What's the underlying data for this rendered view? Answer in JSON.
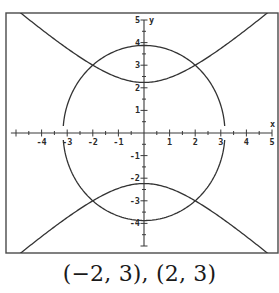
{
  "caption": "(−2, 3), (2, 3)",
  "chart_data": {
    "type": "line",
    "title": "",
    "xlabel": "x",
    "ylabel": "y",
    "xlim": [
      -5.6,
      5.2
    ],
    "ylim": [
      -5.3,
      5.3
    ],
    "grid": false,
    "x_ticks": [
      -4,
      -3,
      -2,
      -1,
      1,
      2,
      3,
      4,
      5
    ],
    "y_ticks": [
      -4,
      -3,
      -2,
      -1,
      1,
      2,
      3,
      4,
      5
    ],
    "x_tick_labels": [
      "-4",
      "-3",
      "-2",
      "-1",
      "1",
      "2",
      "3",
      "4",
      "5"
    ],
    "y_tick_labels": [
      "-4",
      "-3",
      "-2",
      "-1",
      "1",
      "2",
      "3",
      "4",
      "5"
    ],
    "series": [
      {
        "name": "ellipse",
        "equation": "x^2/10 + y^2/15 = 1",
        "semi_axis_x": 3.16,
        "semi_axis_y": 3.87
      },
      {
        "name": "hyperbola",
        "equation": "y^2 - x^2 = 5",
        "vertex_y": 2.24
      }
    ],
    "intersections": [
      [
        -2,
        3
      ],
      [
        2,
        3
      ],
      [
        -2,
        -3
      ],
      [
        2,
        -3
      ]
    ]
  },
  "layout": {
    "frame": {
      "left": 6,
      "top": 13,
      "right": 278,
      "bottom": 253
    },
    "origin_px": [
      144,
      133
    ],
    "unit_x_px": 25.6,
    "unit_y_px": 22.6,
    "y_axis_top": 5,
    "y_axis_bottom": -5,
    "x_axis_left": -5.2,
    "x_axis_right": 5,
    "stroke_color": "#333333"
  }
}
